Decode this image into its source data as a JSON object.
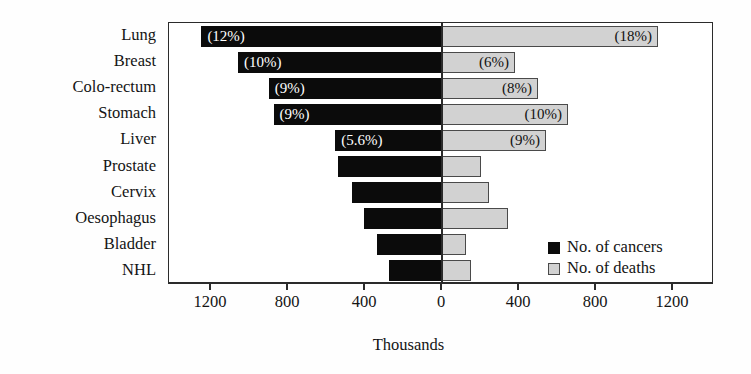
{
  "chart_data": {
    "type": "bar",
    "orientation": "horizontal",
    "style": "bidirectional-population-pyramid",
    "title": "",
    "xlabel": "Thousands",
    "ylabel": "",
    "categories": [
      "Lung",
      "Breast",
      "Colo-rectum",
      "Stomach",
      "Liver",
      "Prostate",
      "Cervix",
      "Oesophagus",
      "Bladder",
      "NHL"
    ],
    "axis": {
      "tick_values": [
        1200,
        800,
        400,
        0,
        400,
        800,
        1200
      ],
      "tick_labels": [
        "1200",
        "800",
        "400",
        "0",
        "400",
        "800",
        "1200"
      ],
      "left_max": 1400,
      "right_max": 1400,
      "grid": false
    },
    "legend": {
      "position": "inside-bottom-right",
      "entries": [
        {
          "label": "No. of cancers",
          "color": "#0b0b0b",
          "side": "left"
        },
        {
          "label": "No. of deaths",
          "color": "#d2d2d2",
          "side": "right"
        }
      ]
    },
    "series": [
      {
        "name": "No. of cancers",
        "side": "left",
        "color": "#0b0b0b",
        "values": [
          1250,
          1060,
          900,
          875,
          555,
          540,
          468,
          405,
          338,
          275
        ],
        "data_labels": [
          "(12%)",
          "(10%)",
          "(9%)",
          "(9%)",
          "(5.6%)",
          "",
          "",
          "",
          "",
          ""
        ]
      },
      {
        "name": "No. of deaths",
        "side": "right",
        "color": "#d2d2d2",
        "values": [
          1122,
          379,
          499,
          655,
          540,
          203,
          244,
          343,
          125,
          151
        ],
        "data_labels": [
          "(18%)",
          "(6%)",
          "(8%)",
          "(10%)",
          "(9%)",
          "",
          "",
          "",
          "",
          ""
        ]
      }
    ]
  }
}
